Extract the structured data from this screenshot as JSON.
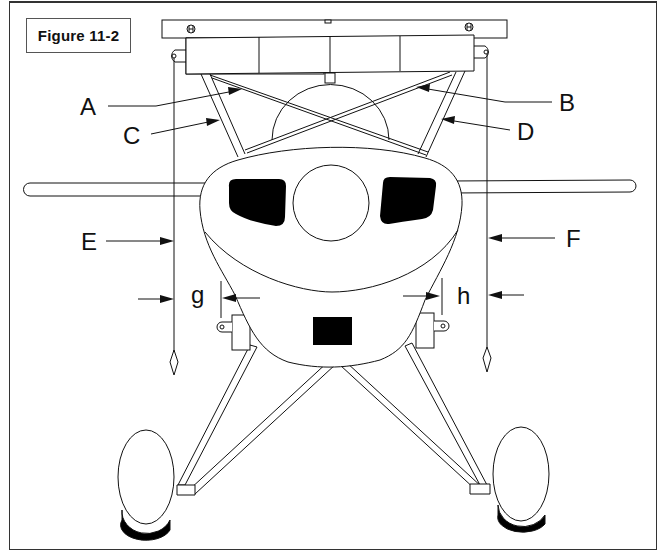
{
  "figure": {
    "title": "Figure 11-2"
  },
  "callouts": {
    "A": "A",
    "B": "B",
    "C": "C",
    "D": "D",
    "E": "E",
    "F": "F",
    "g": "g",
    "h": "h"
  },
  "colors": {
    "line": "#111111",
    "fill_dark": "#000000",
    "background": "#ffffff"
  }
}
